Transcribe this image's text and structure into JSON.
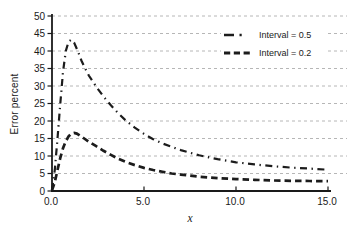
{
  "colors": {
    "background": "#ffffff",
    "axis": "#1a1a1a",
    "grid": "#b6b6b6",
    "text": "#1a1a1a",
    "series": "#1c1c1c",
    "legend_background": "#ffffff"
  },
  "chart_data": {
    "type": "line",
    "title": "",
    "xlabel": "x",
    "ylabel": "Error percent",
    "xlim": [
      0,
      15
    ],
    "ylim": [
      0,
      50
    ],
    "xticks": [
      0,
      5,
      10,
      15
    ],
    "xtick_labels": [
      "0.0",
      "5.0",
      "10.0",
      "15.0"
    ],
    "yticks": [
      0,
      5,
      10,
      15,
      20,
      25,
      30,
      35,
      40,
      45,
      50
    ],
    "ytick_labels": [
      "0",
      "5",
      "10",
      "15",
      "20",
      "25",
      "30",
      "35",
      "40",
      "45",
      "50"
    ],
    "grid": "horizontal dashed gray lines at every y tick",
    "legend": {
      "position": "top-right",
      "entries": [
        {
          "label": "Interval = 0.5",
          "style": "dash-dot"
        },
        {
          "label": "Interval = 0.2",
          "style": "dashed"
        }
      ]
    },
    "series": [
      {
        "name": "Interval = 0.5",
        "style": "dash-dot",
        "peak": {
          "x": 1.0,
          "y": 43
        },
        "points": [
          [
            0,
            0.3
          ],
          [
            0.15,
            6
          ],
          [
            0.3,
            15
          ],
          [
            0.45,
            25
          ],
          [
            0.6,
            34
          ],
          [
            0.75,
            40
          ],
          [
            0.9,
            42.7
          ],
          [
            1.05,
            43.2
          ],
          [
            1.2,
            42.4
          ],
          [
            1.4,
            40
          ],
          [
            1.6,
            37.3
          ],
          [
            1.8,
            35
          ],
          [
            2.0,
            33
          ],
          [
            2.4,
            29.8
          ],
          [
            2.8,
            27
          ],
          [
            3.2,
            24.5
          ],
          [
            3.6,
            22.2
          ],
          [
            4.0,
            20.2
          ],
          [
            4.5,
            18.1
          ],
          [
            5.0,
            16.3
          ],
          [
            5.5,
            14.8
          ],
          [
            6.0,
            13.6
          ],
          [
            6.5,
            12.6
          ],
          [
            7.0,
            11.7
          ],
          [
            7.5,
            10.9
          ],
          [
            8.0,
            10.2
          ],
          [
            9.0,
            9.1
          ],
          [
            10.0,
            8.2
          ],
          [
            11.0,
            7.6
          ],
          [
            12.0,
            7.1
          ],
          [
            13.0,
            6.7
          ],
          [
            14.0,
            6.4
          ],
          [
            15.0,
            6.1
          ]
        ]
      },
      {
        "name": "Interval = 0.2",
        "style": "dashed",
        "peak": {
          "x": 1.2,
          "y": 16.6
        },
        "points": [
          [
            0,
            0.2
          ],
          [
            0.15,
            2.5
          ],
          [
            0.3,
            6
          ],
          [
            0.45,
            9.5
          ],
          [
            0.6,
            12.2
          ],
          [
            0.75,
            14.2
          ],
          [
            0.9,
            15.6
          ],
          [
            1.05,
            16.4
          ],
          [
            1.2,
            16.6
          ],
          [
            1.35,
            16.4
          ],
          [
            1.5,
            15.9
          ],
          [
            1.75,
            15
          ],
          [
            2.0,
            14.1
          ],
          [
            2.4,
            12.8
          ],
          [
            2.8,
            11.5
          ],
          [
            3.2,
            10.3
          ],
          [
            3.6,
            9.2
          ],
          [
            4.0,
            8.3
          ],
          [
            4.5,
            7.4
          ],
          [
            5.0,
            6.6
          ],
          [
            5.5,
            6.0
          ],
          [
            6.0,
            5.5
          ],
          [
            6.5,
            5.0
          ],
          [
            7.0,
            4.7
          ],
          [
            7.5,
            4.4
          ],
          [
            8.0,
            4.1
          ],
          [
            9.0,
            3.7
          ],
          [
            10.0,
            3.4
          ],
          [
            11.0,
            3.2
          ],
          [
            12.0,
            3.0
          ],
          [
            13.0,
            2.9
          ],
          [
            14.0,
            2.85
          ],
          [
            15.0,
            2.8
          ]
        ]
      }
    ]
  }
}
